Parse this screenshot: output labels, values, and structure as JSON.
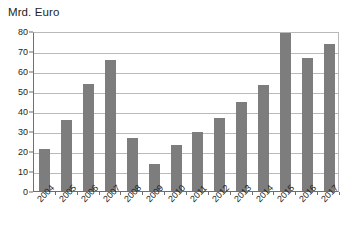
{
  "chart_data": {
    "type": "bar",
    "title": "Mrd. Euro",
    "subtitle": "",
    "xlabel": "",
    "ylabel": "Mrd. Euro",
    "ylim": [
      0,
      80
    ],
    "yticks": [
      0,
      10,
      20,
      30,
      40,
      50,
      60,
      70,
      80
    ],
    "grid": true,
    "legend": "none",
    "bar_color": "#7d7d7d",
    "categories": [
      "2004",
      "2005",
      "2006",
      "2007",
      "2008",
      "2009",
      "2010",
      "2011",
      "2012",
      "2013",
      "2014",
      "2015",
      "2016",
      "2017"
    ],
    "values": [
      21,
      35.5,
      53.5,
      65.5,
      26.5,
      13.5,
      23,
      29.5,
      36.5,
      44.5,
      53,
      79,
      66.5,
      73.5
    ]
  }
}
